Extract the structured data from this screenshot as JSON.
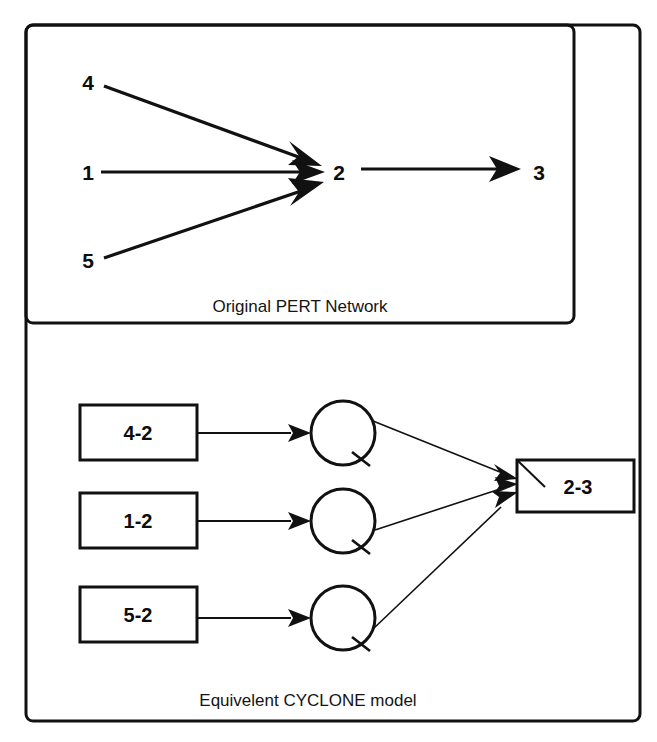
{
  "figure": {
    "panels": [
      {
        "id": "pert",
        "caption": "Original PERT Network",
        "nodes": [
          {
            "id": "n4",
            "label": "4",
            "x": 88,
            "y": 90
          },
          {
            "id": "n1",
            "label": "1",
            "x": 88,
            "y": 176
          },
          {
            "id": "n5",
            "label": "5",
            "x": 88,
            "y": 262
          },
          {
            "id": "n2",
            "label": "2",
            "x": 339,
            "y": 176
          },
          {
            "id": "n3",
            "label": "3",
            "x": 539,
            "y": 176
          }
        ],
        "edges": [
          {
            "from": "4",
            "to": "2"
          },
          {
            "from": "1",
            "to": "2"
          },
          {
            "from": "5",
            "to": "2"
          },
          {
            "from": "2",
            "to": "3"
          }
        ]
      },
      {
        "id": "cyclone",
        "caption": "Equivelent CYCLONE model",
        "queue_nodes": [
          {
            "id": "q1",
            "label": "4-2"
          },
          {
            "id": "q2",
            "label": "1-2"
          },
          {
            "id": "q3",
            "label": "5-2"
          }
        ],
        "circle_nodes": [
          {
            "id": "c1",
            "label": ""
          },
          {
            "id": "c2",
            "label": ""
          },
          {
            "id": "c3",
            "label": ""
          }
        ],
        "combi_node": {
          "id": "combi",
          "label": "2-3"
        },
        "edges": [
          {
            "from": "4-2",
            "to": "c1"
          },
          {
            "from": "1-2",
            "to": "c2"
          },
          {
            "from": "5-2",
            "to": "c3"
          },
          {
            "from": "c1",
            "to": "2-3"
          },
          {
            "from": "c2",
            "to": "2-3"
          },
          {
            "from": "c3",
            "to": "2-3"
          }
        ]
      }
    ],
    "colors": {
      "ink": "#111111",
      "paper": "#ffffff"
    }
  }
}
